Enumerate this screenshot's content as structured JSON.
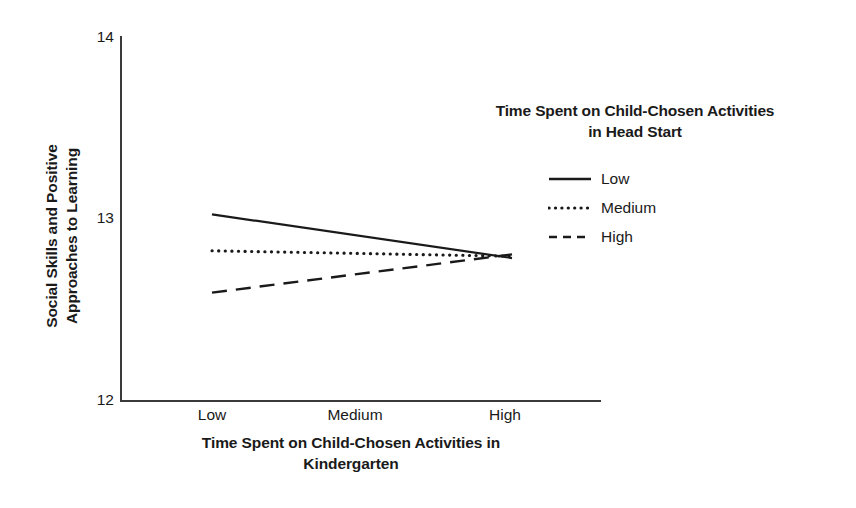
{
  "chart_data": {
    "type": "line",
    "title": "",
    "xlabel": "Time Spent on Child-Chosen Activities in Kindergarten",
    "ylabel": "Social Skills and Positive Approaches to Learning",
    "categories": [
      "Low",
      "Medium",
      "High"
    ],
    "ylim": [
      12,
      14
    ],
    "yticks": [
      "12",
      "13",
      "14"
    ],
    "grid": false,
    "legend_position": "upper-right",
    "legend_title": "Time Spent on Child-Chosen Activities in Head Start",
    "series": [
      {
        "name": "Low",
        "style": "solid",
        "color": "#1a1a1a",
        "values": [
          13.02,
          12.9,
          12.78
        ]
      },
      {
        "name": "Medium",
        "style": "dotted",
        "color": "#1a1a1a",
        "values": [
          12.82,
          12.81,
          12.79
        ]
      },
      {
        "name": "High",
        "style": "dashed",
        "color": "#1a1a1a",
        "values": [
          12.59,
          12.7,
          12.8
        ]
      }
    ]
  },
  "axes": {
    "y_title_line1": "Social Skills and Positive",
    "y_title_line2": "Approaches to Learning",
    "y_ticks": [
      {
        "label": "14",
        "value": 14
      },
      {
        "label": "13",
        "value": 13
      },
      {
        "label": "12",
        "value": 12
      }
    ],
    "x_ticks": [
      {
        "label": "Low"
      },
      {
        "label": "Medium"
      },
      {
        "label": "High"
      }
    ],
    "x_title_line1": "Time Spent on Child-Chosen Activities in",
    "x_title_line2": "Kindergarten"
  },
  "legend": {
    "title_line1": "Time Spent on Child-Chosen Activities",
    "title_line2": "in Head Start",
    "items": [
      {
        "label": "Low",
        "style": "solid"
      },
      {
        "label": "Medium",
        "style": "dotted"
      },
      {
        "label": "High",
        "style": "dashed"
      }
    ]
  },
  "colors": {
    "line": "#1a1a1a",
    "axis": "#3a3a3a",
    "background": "#ffffff"
  }
}
